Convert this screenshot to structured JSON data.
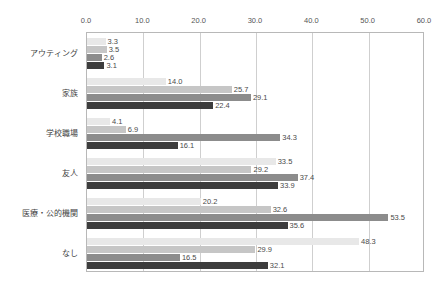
{
  "chart_data": {
    "type": "bar",
    "orientation": "horizontal",
    "title": "",
    "subtitle": "",
    "xlabel": "",
    "ylabel": "",
    "xlim": [
      0.0,
      60.0
    ],
    "xticks": [
      "0.0",
      "10.0",
      "20.0",
      "30.0",
      "40.0",
      "50.0",
      "60.0"
    ],
    "xtick_values": [
      0.0,
      10.0,
      20.0,
      30.0,
      40.0,
      50.0,
      60.0
    ],
    "grid": true,
    "grid_axis": "x",
    "legend": false,
    "legend_position": "none",
    "categories": [
      "アウティング",
      "家族",
      "学校職場",
      "友人",
      "医療・公的機関",
      "なし"
    ],
    "series": [
      {
        "name": "series-1",
        "color": "#e8e8e8",
        "values": [
          3.3,
          14.0,
          4.1,
          33.5,
          20.2,
          48.3
        ],
        "labels": [
          "3.3",
          "14.0",
          "4.1",
          "33.5",
          "20.2",
          "48.3"
        ]
      },
      {
        "name": "series-2",
        "color": "#c6c6c6",
        "values": [
          3.5,
          25.7,
          6.9,
          29.2,
          32.6,
          29.9
        ],
        "labels": [
          "3.5",
          "25.7",
          "6.9",
          "29.2",
          "32.6",
          "29.9"
        ]
      },
      {
        "name": "series-3",
        "color": "#8c8c8c",
        "values": [
          2.6,
          29.1,
          34.3,
          37.4,
          53.5,
          16.5
        ],
        "labels": [
          "2.6",
          "29.1",
          "34.3",
          "37.4",
          "53.5",
          "16.5"
        ]
      },
      {
        "name": "series-4",
        "color": "#3d3d3d",
        "values": [
          3.1,
          22.4,
          16.1,
          33.9,
          35.6,
          32.1
        ],
        "labels": [
          "3.1",
          "22.4",
          "16.1",
          "33.9",
          "35.6",
          "32.1"
        ]
      }
    ],
    "axis_color": "#b8b8b8",
    "grid_color": "#cfcfcf",
    "background": "#ffffff"
  }
}
